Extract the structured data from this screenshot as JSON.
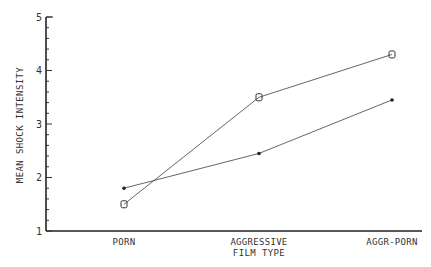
{
  "chart_data": {
    "type": "line",
    "title": "",
    "xlabel": "FILM TYPE",
    "ylabel": "MEAN SHOCK INTENSITY",
    "categories": [
      "PORN",
      "AGGRESSIVE",
      "AGGR-PORN"
    ],
    "ylim": [
      1,
      5
    ],
    "yticks": [
      1,
      2,
      3,
      4,
      5
    ],
    "y_minor_ticks_per_unit": 5,
    "grid": false,
    "legend": null,
    "series": [
      {
        "name": "O",
        "marker": "O",
        "values": [
          1.5,
          3.5,
          4.3
        ]
      },
      {
        "name": "*",
        "marker": "*",
        "values": [
          1.8,
          2.45,
          3.45
        ]
      }
    ]
  },
  "labels": {
    "ylabel": "MEAN SHOCK INTENSITY",
    "xlabel": "FILM TYPE",
    "cat0": "PORN",
    "cat1": "AGGRESSIVE",
    "cat2": "AGGR-PORN",
    "y1": "1",
    "y2": "2",
    "y3": "3",
    "y4": "4",
    "y5": "5"
  }
}
